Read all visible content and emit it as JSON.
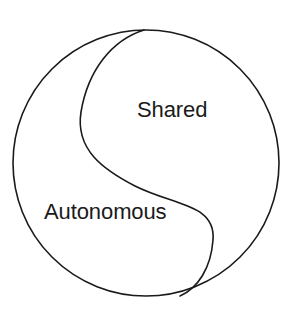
{
  "diagram": {
    "type": "divided-circle",
    "background_color": "#ffffff",
    "stroke_color": "#1a1a1a",
    "stroke_width": 1.6,
    "circle": {
      "center_x": 146,
      "center_y": 163,
      "radius": 133
    },
    "divider": {
      "name": "s-curve",
      "start_x": 144,
      "start_y": 30,
      "end_x": 180,
      "end_y": 296,
      "left_extreme_x": 81,
      "left_extreme_y": 112,
      "right_extreme_x": 213,
      "right_extreme_y": 240
    },
    "regions": [
      {
        "id": "shared",
        "label": "Shared",
        "position": "upper-right"
      },
      {
        "id": "autonomous",
        "label": "Autonomous",
        "position": "lower-left"
      }
    ]
  },
  "labels": {
    "shared": "Shared",
    "autonomous": "Autonomous"
  }
}
